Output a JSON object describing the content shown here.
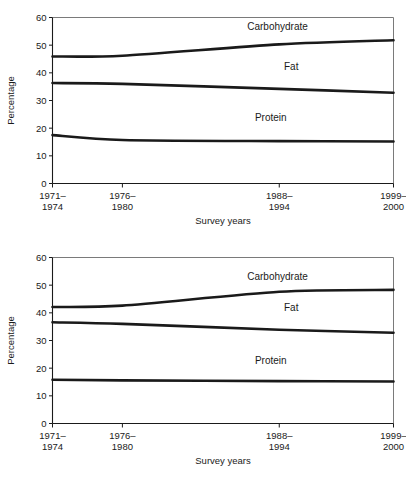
{
  "chart_data": [
    {
      "id": "top",
      "type": "line",
      "title": "",
      "xlabel": "Survey years",
      "ylabel": "Percentage",
      "ylim": [
        0,
        60
      ],
      "yticks": [
        0,
        10,
        20,
        30,
        40,
        50,
        60
      ],
      "ytick_labels": [
        "0",
        "10",
        "20",
        "30",
        "40",
        "50",
        "60"
      ],
      "grid": false,
      "legend_position": "inline-right",
      "categories": [
        "1971–1974",
        "1976–1980",
        "1988–1994",
        "1999–2000"
      ],
      "category_lines": [
        [
          "1971–",
          "1974"
        ],
        [
          "1976–",
          "1980"
        ],
        [
          "1988–",
          "1994"
        ],
        [
          "1999–",
          "2000"
        ]
      ],
      "x_positions": [
        0.0,
        0.205,
        0.665,
        1.0
      ],
      "series": [
        {
          "name": "Carbohydrate",
          "values": [
            45.9,
            46.2,
            50.3,
            51.8
          ],
          "label_x": 0.66,
          "label_y": 55.5
        },
        {
          "name": "Fat",
          "values": [
            36.3,
            36.0,
            34.2,
            32.8
          ],
          "label_x": 0.7,
          "label_y": 41.0
        },
        {
          "name": "Protein",
          "values": [
            17.5,
            15.7,
            15.3,
            15.2
          ],
          "label_x": 0.64,
          "label_y": 22.5
        }
      ]
    },
    {
      "id": "bottom",
      "type": "line",
      "title": "",
      "xlabel": "Survey years",
      "ylabel": "Percentage",
      "ylim": [
        0,
        60
      ],
      "yticks": [
        0,
        10,
        20,
        30,
        40,
        50,
        60
      ],
      "ytick_labels": [
        "0",
        "10",
        "20",
        "30",
        "40",
        "50",
        "60"
      ],
      "grid": false,
      "legend_position": "inline-right",
      "categories": [
        "1971–1974",
        "1976–1980",
        "1988–1994",
        "1999–2000"
      ],
      "category_lines": [
        [
          "1971–",
          "1974"
        ],
        [
          "1976–",
          "1980"
        ],
        [
          "1988–",
          "1994"
        ],
        [
          "1999–",
          "2000"
        ]
      ],
      "x_positions": [
        0.0,
        0.205,
        0.665,
        1.0
      ],
      "series": [
        {
          "name": "Carbohydrate",
          "values": [
            42.1,
            42.6,
            47.6,
            48.3
          ],
          "label_x": 0.66,
          "label_y": 52.0
        },
        {
          "name": "Fat",
          "values": [
            36.6,
            36.0,
            33.9,
            32.8
          ],
          "label_x": 0.7,
          "label_y": 40.5
        },
        {
          "name": "Protein",
          "values": [
            15.8,
            15.6,
            15.3,
            15.2
          ],
          "label_x": 0.64,
          "label_y": 21.5
        }
      ]
    }
  ],
  "colors": {
    "line": "#1a1a1a",
    "frame": "#7a7a7a",
    "background": "#ffffff"
  }
}
